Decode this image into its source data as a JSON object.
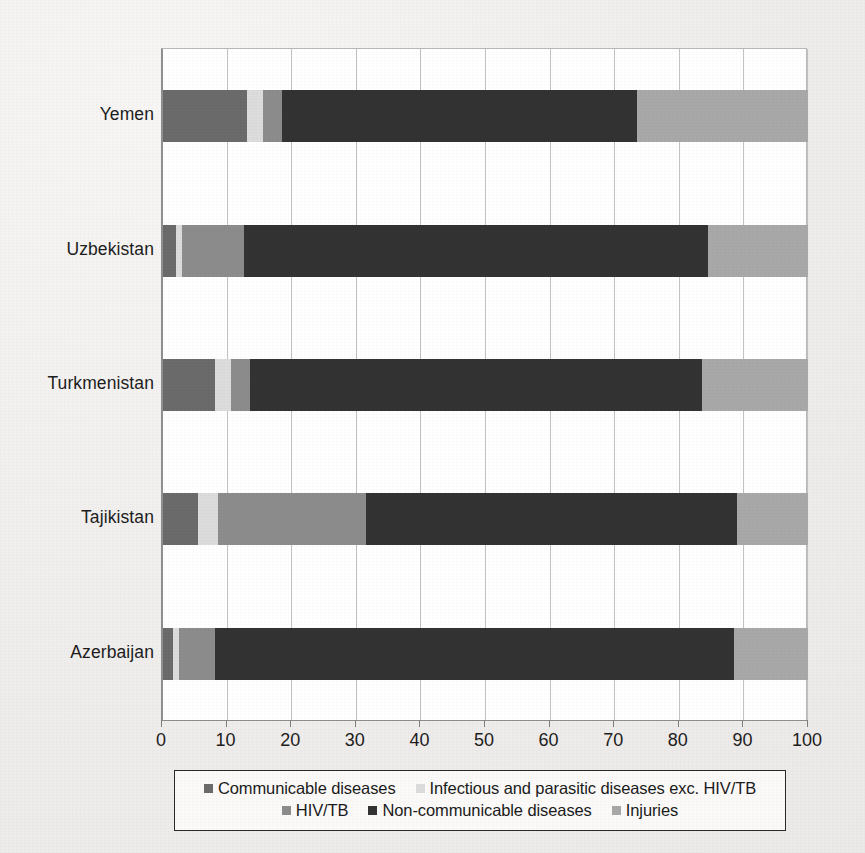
{
  "chart_data": {
    "type": "bar",
    "orientation": "horizontal",
    "stacked": true,
    "title": "",
    "subtitle": "",
    "xlabel": "",
    "ylabel": "",
    "xlim": [
      0,
      100
    ],
    "xticks": [
      0,
      10,
      20,
      30,
      40,
      50,
      60,
      70,
      80,
      90,
      100
    ],
    "xtick_labels": [
      "0",
      "10",
      "20",
      "30",
      "40",
      "50",
      "60",
      "70",
      "80",
      "90",
      "100"
    ],
    "grid": true,
    "grid_axis": "x",
    "legend_position": "bottom",
    "categories": [
      "Yemen",
      "Uzbekistan",
      "Turkmenistan",
      "Tajikistan",
      "Azerbaijan"
    ],
    "series": [
      {
        "name": "Communicable diseases",
        "color": "#6b6b6b",
        "values": [
          13.0,
          2.0,
          8.0,
          5.5,
          1.5
        ]
      },
      {
        "name": "Infectious and parasitic diseases exc. HIV/TB",
        "color": "#dcdcdc",
        "values": [
          2.5,
          1.0,
          2.5,
          3.0,
          1.0
        ]
      },
      {
        "name": "HIV/TB",
        "color": "#8c8c8c",
        "values": [
          3.0,
          9.5,
          3.0,
          23.0,
          5.5
        ]
      },
      {
        "name": "Non-communicable diseases",
        "color": "#333333",
        "values": [
          55.0,
          72.0,
          70.0,
          57.5,
          80.5
        ]
      },
      {
        "name": "Injuries",
        "color": "#a8a8a8",
        "values": [
          26.5,
          15.5,
          16.5,
          11.0,
          11.5
        ]
      }
    ],
    "cumulative_boundaries": {
      "Yemen": [
        0,
        13.0,
        15.5,
        18.5,
        73.5,
        100
      ],
      "Uzbekistan": [
        0,
        2.0,
        3.0,
        12.5,
        84.5,
        100
      ],
      "Turkmenistan": [
        0,
        8.0,
        10.5,
        13.5,
        83.5,
        100
      ],
      "Tajikistan": [
        0,
        5.5,
        8.5,
        31.5,
        89.0,
        100
      ],
      "Azerbaijan": [
        0,
        1.5,
        2.5,
        8.0,
        88.5,
        100
      ]
    }
  },
  "legend": {
    "row1": [
      {
        "label": "Communicable diseases",
        "color": "#6b6b6b"
      },
      {
        "label": "Infectious and parasitic diseases exc. HIV/TB",
        "color": "#dcdcdc"
      }
    ],
    "row2": [
      {
        "label": "HIV/TB",
        "color": "#8c8c8c"
      },
      {
        "label": "Non-communicable diseases",
        "color": "#333333"
      },
      {
        "label": "Injuries",
        "color": "#a8a8a8"
      }
    ]
  },
  "colors": {
    "communicable": "#6b6b6b",
    "infectious": "#dcdcdc",
    "hiv_tb": "#8c8c8c",
    "non_communicable": "#333333",
    "injuries": "#a8a8a8",
    "page_background": "#f4f2f0",
    "plot_background": "#ffffff",
    "gridline": "#c2c2c2",
    "axis": "#8f8f8f",
    "text": "#1d1d1d",
    "legend_border": "#2a2a2a"
  }
}
